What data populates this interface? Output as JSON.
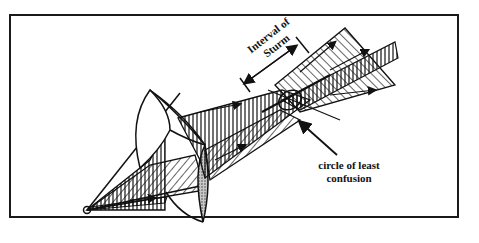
{
  "diagram": {
    "labels": {
      "interval_line1": "Interval of",
      "interval_line2": "Sturm",
      "circle_line1": "circle of least",
      "circle_line2": "confusion"
    },
    "colors": {
      "ink": "#111111",
      "lens_shade": "#9a9a9a",
      "background": "#ffffff"
    },
    "icons": [
      "point-source-icon",
      "arrow-icon",
      "lens-icon"
    ]
  }
}
